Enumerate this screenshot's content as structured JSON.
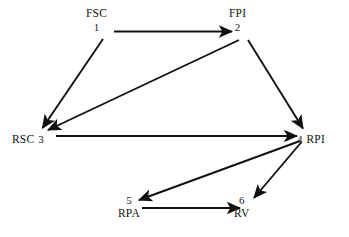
{
  "diagram": {
    "type": "node-link-diagram",
    "background_color": "#ffffff",
    "stroke_color": "#111111",
    "width": 349,
    "height": 237,
    "nodes": [
      {
        "id": "fsc",
        "number": "1",
        "code": "FSC",
        "label_layout": "stacked",
        "x": 102,
        "y": 20
      },
      {
        "id": "fpi",
        "number": "2",
        "code": "FPI",
        "label_layout": "stacked",
        "x": 244,
        "y": 20
      },
      {
        "id": "rsc",
        "number": "3",
        "code": "RSC",
        "label_layout": "inline-code-first",
        "x": 34,
        "y": 136
      },
      {
        "id": "rpi",
        "number": "4",
        "code": "RPI",
        "label_layout": "inline-number-first",
        "x": 312,
        "y": 136
      },
      {
        "id": "rpa",
        "number": "5",
        "code": "RPA",
        "label_layout": "stacked",
        "x": 134,
        "y": 207
      },
      {
        "id": "rv",
        "number": "6",
        "code": "RV",
        "label_layout": "stacked",
        "x": 250,
        "y": 207
      }
    ],
    "edges": [
      {
        "id": "e1",
        "from": "1",
        "to": "2",
        "from_code": "FSC",
        "to_code": "FPI"
      },
      {
        "id": "e2",
        "from": "1",
        "to": "3",
        "from_code": "FSC",
        "to_code": "RSC"
      },
      {
        "id": "e3",
        "from": "2",
        "to": "3",
        "from_code": "FPI",
        "to_code": "RSC"
      },
      {
        "id": "e4",
        "from": "2",
        "to": "4",
        "from_code": "FPI",
        "to_code": "RPI"
      },
      {
        "id": "e5",
        "from": "3",
        "to": "4",
        "from_code": "RSC",
        "to_code": "RPI"
      },
      {
        "id": "e6",
        "from": "4",
        "to": "5",
        "from_code": "RPI",
        "to_code": "RPA"
      },
      {
        "id": "e7",
        "from": "4",
        "to": "6",
        "from_code": "RPI",
        "to_code": "RV"
      },
      {
        "id": "e8",
        "from": "5",
        "to": "6",
        "from_code": "RPA",
        "to_code": "RV"
      }
    ]
  }
}
